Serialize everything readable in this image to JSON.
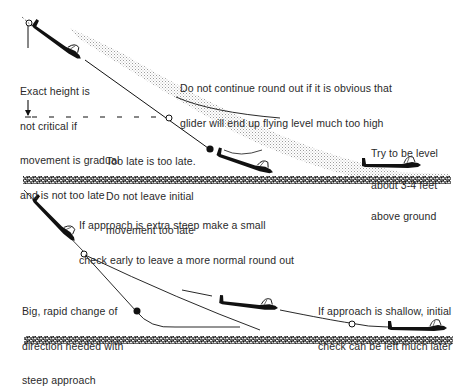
{
  "diagram": {
    "colors": {
      "ink": "#111111",
      "text": "#2a2a2a",
      "stipple": "#9a9a9a",
      "ground": "#3a3a3a",
      "background": "#ffffff"
    },
    "top_panel": {
      "labels": {
        "exact_height": [
          "Exact height is",
          "not critical if",
          "movement is gradual",
          "and is not too late"
        ],
        "do_not_continue": [
          "Do not continue round out if it is obvious that",
          "glider will end up flying level much too high"
        ],
        "too_late": [
          "Too late is too late.",
          "Do not leave initial",
          "movement too late"
        ],
        "try_level": [
          "Try to be level",
          "about 3-4 feet",
          "above ground"
        ]
      },
      "elements": [
        "descending-glider",
        "approach-line",
        "stipple-round-out-band",
        "overshoot-curve",
        "dashed-height-line",
        "open-circle-marker",
        "filled-circle-marker",
        "late-glider",
        "level-glider",
        "ground-strip"
      ]
    },
    "bottom_panel": {
      "labels": {
        "extra_steep": [
          "If approach is extra steep make a small",
          "check early to leave a more normal round out"
        ],
        "big_rapid": [
          "Big, rapid change of",
          "direction needed with",
          "steep approach"
        ],
        "shallow": [
          "If approach is shallow, initial",
          "check can be left much later"
        ]
      },
      "elements": [
        "steep-glider",
        "early-check-curve",
        "late-check-curve",
        "open-circle-marker",
        "filled-circle-marker",
        "shallow-glider",
        "shallow-path",
        "landing-glider",
        "ground-strip"
      ]
    }
  }
}
